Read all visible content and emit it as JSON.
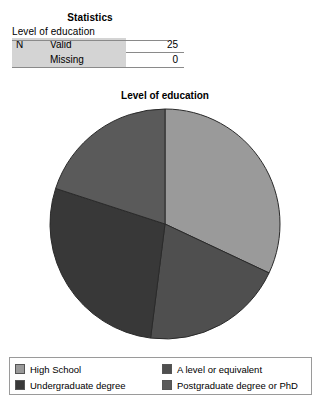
{
  "statistics": {
    "title": "Statistics",
    "caption": "Level of education",
    "rows": [
      {
        "n_label": "N",
        "stat_label": "Valid",
        "value": "25"
      },
      {
        "n_label": "",
        "stat_label": "Missing",
        "value": "0"
      }
    ]
  },
  "chart_data": {
    "type": "pie",
    "title": "Level of education",
    "categories": [
      "High School",
      "A level or equivalent",
      "Undergraduate degree",
      "Postgraduate degree or PhD"
    ],
    "values": [
      32,
      20,
      28,
      20
    ],
    "counts": [
      8,
      5,
      7,
      5
    ],
    "unit": "percent",
    "total_n": 25,
    "start_angle_deg": 0,
    "direction": "clockwise",
    "legend_position": "bottom",
    "grid": false,
    "colors": [
      "#9a9a9a",
      "#4f4f4f",
      "#383838",
      "#5a5a5a"
    ],
    "slice_edge_color": "#2a2a2a"
  },
  "legend": {
    "items": [
      {
        "label": "High School",
        "color": "#9a9a9a"
      },
      {
        "label": "A level or equivalent",
        "color": "#4f4f4f"
      },
      {
        "label": "Undergraduate degree",
        "color": "#383838"
      },
      {
        "label": "Postgraduate degree or PhD",
        "color": "#5a5a5a"
      }
    ]
  }
}
